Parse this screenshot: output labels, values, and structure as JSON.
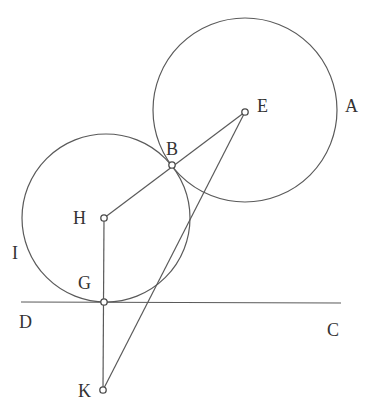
{
  "diagram": {
    "type": "geometric-construction",
    "colors": {
      "stroke": "#5a5a5a",
      "text": "#333333",
      "background": "#ffffff"
    },
    "circles": [
      {
        "name": "circle-E",
        "center": "E",
        "label": "A",
        "cx": 245,
        "cy": 110,
        "r": 92
      },
      {
        "name": "circle-H",
        "center": "H",
        "label": "I",
        "cx": 106,
        "cy": 218,
        "r": 84
      }
    ],
    "lines": [
      {
        "name": "line-DC",
        "from": "D",
        "to": "C",
        "x1": 21,
        "y1": 302,
        "x2": 341,
        "y2": 303
      },
      {
        "name": "segment-HE",
        "from": "H",
        "to": "E"
      },
      {
        "name": "segment-HK",
        "from": "H",
        "to": "K"
      },
      {
        "name": "segment-EK",
        "from": "E",
        "to": "K"
      }
    ],
    "points": [
      {
        "id": "E",
        "x": 245,
        "y": 112
      },
      {
        "id": "B",
        "x": 172,
        "y": 165
      },
      {
        "id": "H",
        "x": 104,
        "y": 218
      },
      {
        "id": "G",
        "x": 104,
        "y": 302
      },
      {
        "id": "K",
        "x": 103,
        "y": 390
      }
    ],
    "labels": {
      "A": "A",
      "B": "B",
      "C": "C",
      "D": "D",
      "E": "E",
      "G": "G",
      "H": "H",
      "I": "I",
      "K": "K"
    }
  }
}
